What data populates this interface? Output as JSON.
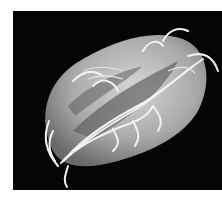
{
  "image": {
    "subject": "sem-micrograph-flagellated-protozoan",
    "background_color": "#050505",
    "page_color": "#ffffff",
    "cell_color": "#bdbdbd",
    "flagella_color": "#f2f2f2"
  }
}
